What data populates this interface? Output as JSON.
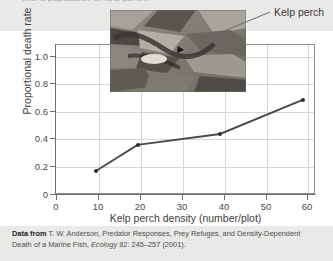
{
  "figure": {
    "clipped_top_caption": "...of a population of kelp perch.",
    "callout_label": "Kelp perch",
    "photo_alt": "kelp-perch-underwater-photo"
  },
  "chart_data": {
    "type": "line",
    "title": "",
    "xlabel": "Kelp perch density (number/plot)",
    "ylabel": "Proportional death rate",
    "x": [
      10,
      20,
      40,
      60
    ],
    "values": [
      0.17,
      0.36,
      0.44,
      0.69
    ],
    "series": [
      {
        "name": "Proportional death rate",
        "values": [
          0.17,
          0.36,
          0.44,
          0.69
        ]
      }
    ],
    "xlim": [
      0,
      63
    ],
    "ylim": [
      0,
      1.1
    ],
    "xticks": [
      0,
      10,
      20,
      30,
      40,
      50,
      60
    ],
    "xticklabels": [
      "0",
      "10",
      "20",
      "30",
      "40",
      "50",
      "60"
    ],
    "yticks": [
      0,
      0.2,
      0.4,
      0.6,
      0.8,
      1.0
    ],
    "yticklabels": [
      "0",
      "0.2",
      "0.4",
      "0.6",
      "0.8",
      "1.0"
    ],
    "grid": true,
    "legend": "none",
    "marker": "filled-circle",
    "line_color": "#4a4a4a",
    "marker_color": "#2b2b2b"
  },
  "citation": {
    "lead": "Data from",
    "authors": " T. W. Anderson, Predator Responses, Prey Refuges, and Density-Dependent Death  of a Marine Fish, ",
    "journal": "Ecology",
    "locator": " 82: 245–257 (2001)."
  }
}
